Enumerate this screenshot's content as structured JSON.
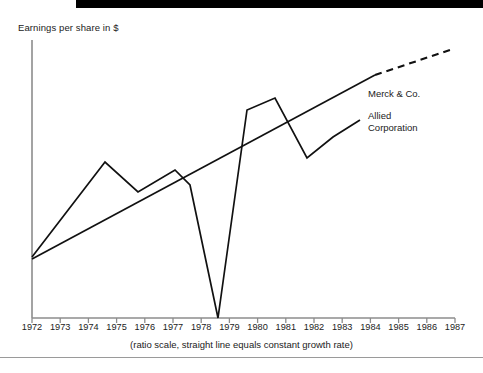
{
  "decor": {
    "top_bar_color": "#000000",
    "bottom_rule_color": "#9a9a9a"
  },
  "axis": {
    "y_title": "Earnings per share in $",
    "axis_color": "#8c8c8c",
    "x_tick_labels": [
      "1972",
      "1973",
      "1974",
      "1975",
      "1976",
      "1977",
      "1978",
      "1979",
      "1980",
      "1981",
      "1982",
      "1983",
      "1984",
      "1985",
      "1986",
      "1987"
    ]
  },
  "caption": "(ratio scale, straight line equals constant growth rate)",
  "legend": {
    "merck": "Merck & Co.",
    "allied": "Allied\nCorporation"
  },
  "chart_data": {
    "type": "line",
    "title": "",
    "subtitle": "",
    "xlabel": "",
    "ylabel": "Earnings per share in $",
    "annotation": "(ratio scale, straight line equals constant growth rate)",
    "scale": "ratio (logarithmic)",
    "grid": false,
    "legend_position": "right-inline",
    "xlim": [
      1972,
      1987
    ],
    "x": [
      1972,
      1973,
      1974,
      1975,
      1976,
      1977,
      1978,
      1979,
      1980,
      1981,
      1982,
      1983,
      1984,
      1985,
      1986,
      1987
    ],
    "series": [
      {
        "name": "Merck & Co.",
        "style": "solid-then-dashed straight trend line",
        "dash_starts_at_x": 1984.2,
        "x": [
          1972,
          1984.2,
          1987
        ],
        "values": [
          0.55,
          3.35,
          4.3
        ],
        "note": "straight line on ratio scale = constant growth rate; dashed portion is projection"
      },
      {
        "name": "Allied Corporation",
        "style": "solid volatile line",
        "x": [
          1972,
          1973,
          1974,
          1975,
          1976,
          1977,
          1978,
          1979,
          1980,
          1981,
          1982,
          1983,
          1984
        ],
        "values": [
          0.55,
          1.55,
          2.45,
          1.75,
          2.1,
          2.35,
          1.95,
          0.05,
          3.5,
          3.9,
          1.85,
          2.35,
          2.7
        ],
        "note": "collapses to near zero in 1979, then spikes to a 1981 peak"
      }
    ]
  },
  "geometry": {
    "note": "pixel coordinates used by the template to draw the polylines",
    "origin_x": 32,
    "origin_y": 318,
    "x_per_year": 28.2,
    "y_axis_top": 40,
    "x_axis_right": 455,
    "allied_points": "32,257 105,162 138,192 175,170 190,185 218,318 247,110 275,98 307,158 333,137 360,120",
    "merck_solid_points": "32,259 375,75",
    "merck_dashed_points": "375,75 450,50"
  }
}
